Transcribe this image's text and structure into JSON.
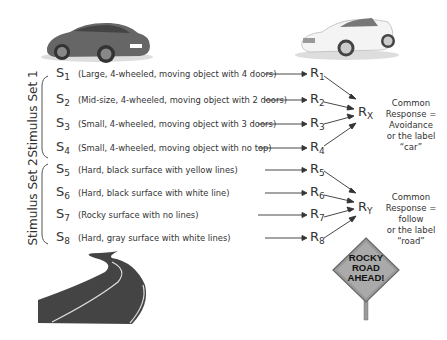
{
  "set1": {
    "label": "Stimulus Set 1",
    "stimuli": [
      {
        "s": "S",
        "sub": "1",
        "desc": "(Large, 4-wheeled, moving object with 4 doors)",
        "r": "R",
        "rsub": "1"
      },
      {
        "s": "S",
        "sub": "2",
        "desc": "(Mid-size, 4-wheeled, moving object with 2 doors)",
        "r": "R",
        "rsub": "2"
      },
      {
        "s": "S",
        "sub": "3",
        "desc": "(Small, 4-wheeled, moving object with 3 doors)",
        "r": "R",
        "rsub": "3"
      },
      {
        "s": "S",
        "sub": "4",
        "desc": "(Small, 4-wheeled, moving object with no top)",
        "r": "R",
        "rsub": "4"
      }
    ],
    "common_r": "R",
    "common_rsub": "X",
    "common_text": [
      "Common",
      "Response =",
      "Avoidance",
      "or the label",
      "“car”"
    ]
  },
  "set2": {
    "label": "Stimulus Set 2",
    "stimuli": [
      {
        "s": "S",
        "sub": "5",
        "desc": "(Hard, black surface with yellow lines)",
        "r": "R",
        "rsub": "5"
      },
      {
        "s": "S",
        "sub": "6",
        "desc": "(Hard, black surface with white line)",
        "r": "R",
        "rsub": "6"
      },
      {
        "s": "S",
        "sub": "7",
        "desc": "(Rocky surface with no lines)",
        "r": "R",
        "rsub": "7"
      },
      {
        "s": "S",
        "sub": "8",
        "desc": "(Hard, gray surface with white lines)",
        "r": "R",
        "rsub": "8"
      }
    ],
    "common_r": "R",
    "common_rsub": "Y",
    "common_text": [
      "Common",
      "Response =",
      "follow",
      "or the label",
      "“road”"
    ]
  },
  "sign": {
    "lines": [
      "ROCKY",
      "ROAD",
      "AHEAD!"
    ]
  },
  "images": {
    "sedan": "sedan-car-image",
    "convertible": "convertible-car-image",
    "road": "winding-road-image"
  }
}
